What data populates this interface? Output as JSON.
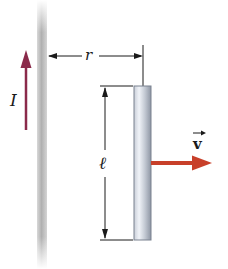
{
  "diagram": {
    "labels": {
      "current": "I",
      "distance": "r",
      "length": "ℓ",
      "velocity": "v"
    },
    "colors": {
      "current_arrow": "#8a2a4a",
      "velocity_arrow": "#c8402a",
      "wire": "#b8b8b8",
      "bar_light": "#e8ecf2",
      "bar_dark": "#8a92a0",
      "dimension_lines": "#1a1a1a"
    }
  }
}
